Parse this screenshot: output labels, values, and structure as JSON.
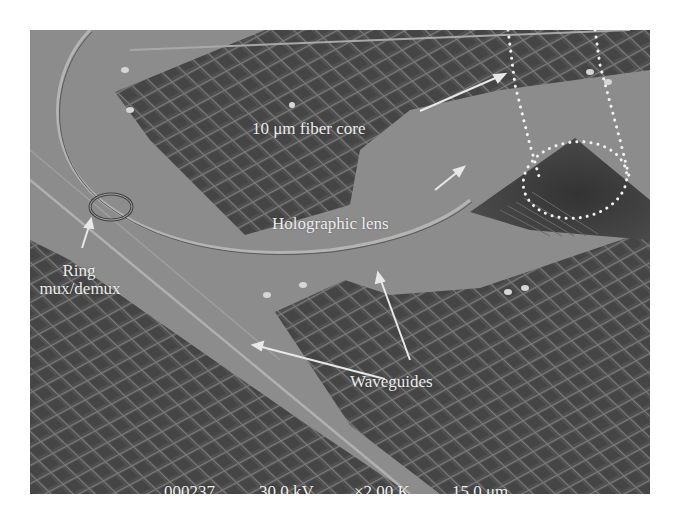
{
  "image": {
    "description": "SEM micrograph of silicon photonic chip with grating coupler, holographic lens, ring mux/demux and waveguides",
    "colors": {
      "substrate": "#8a8a8a",
      "grid_dark": "#4e4e4e",
      "grid_line": "#7a7a7a",
      "annotation": "#ececec",
      "coupler_dark": "#3a3a3a"
    }
  },
  "annotations": {
    "fiber_core": "10 μm fiber core",
    "holographic_lens": "Holographic lens",
    "ring_line1": "Ring",
    "ring_line2": "mux/demux",
    "waveguides": "Waveguides"
  },
  "sem_databar": {
    "image_number": "000237",
    "accelerating_voltage": "30.0 kV",
    "magnification": "×2.00 K",
    "scale": "15.0 μm"
  }
}
